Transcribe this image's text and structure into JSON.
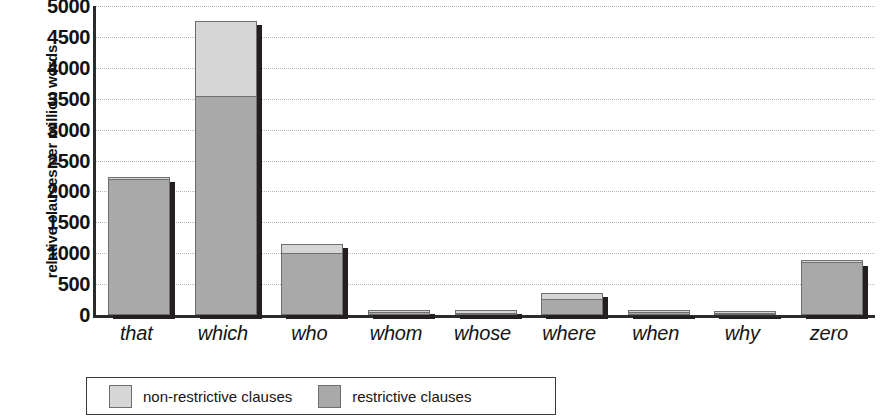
{
  "chart_data": {
    "type": "bar",
    "title": "",
    "xlabel": "",
    "ylabel": "relative clauses per million words",
    "ylim": [
      0,
      5000
    ],
    "ytick_labels": [
      "5000",
      "4500",
      "4000",
      "3500",
      "3000",
      "2500",
      "2000",
      "1500",
      "1000",
      "500",
      "0"
    ],
    "ytick_values": [
      5000,
      4500,
      4000,
      3500,
      3000,
      2500,
      2000,
      1500,
      1000,
      500,
      0
    ],
    "grid": true,
    "stacked": true,
    "legend_position": "bottom-left",
    "categories": [
      "that",
      "which",
      "who",
      "whom",
      "whose",
      "where",
      "when",
      "why",
      "zero"
    ],
    "series": [
      {
        "name": "restrictive clauses",
        "color": "#a9a9a9",
        "values": [
          2200,
          3550,
          1000,
          55,
          40,
          260,
          45,
          20,
          850
        ]
      },
      {
        "name": "non-restrictive clauses",
        "color": "#d6d6d6",
        "values": [
          20,
          1200,
          150,
          25,
          35,
          90,
          10,
          10,
          15
        ]
      }
    ],
    "totals": [
      2220,
      4750,
      1150,
      80,
      75,
      350,
      55,
      30,
      865
    ]
  },
  "axis": {
    "ylabel": "relative clauses per million words",
    "ticks": [
      "5000",
      "4500",
      "4000",
      "3500",
      "3000",
      "2500",
      "2000",
      "1500",
      "1000",
      "500",
      "0"
    ],
    "categories": [
      "that",
      "which",
      "who",
      "whom",
      "whose",
      "where",
      "when",
      "why",
      "zero"
    ]
  },
  "legend": {
    "items": [
      {
        "label": "non-restrictive clauses",
        "swatch": "nonrestrictive"
      },
      {
        "label": "restrictive clauses",
        "swatch": "restrictive"
      }
    ]
  },
  "colors": {
    "non_restrictive": "#d6d6d6",
    "restrictive": "#a9a9a9",
    "axis": "#2b2b2b",
    "grid": "#b9b9b9",
    "bar_shadow": "#231f20"
  }
}
